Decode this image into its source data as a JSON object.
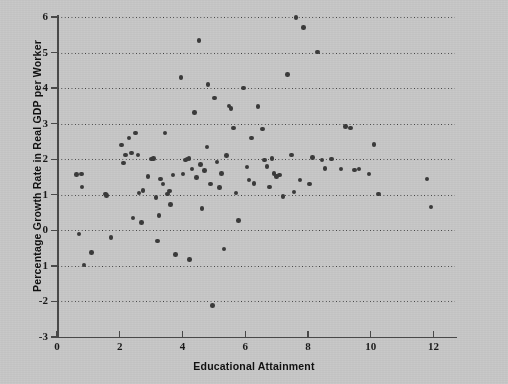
{
  "chart_data": {
    "type": "scatter",
    "title": "",
    "xlabel": "Educational Attainment",
    "ylabel": "Percentage Growth Rate in Real GDP per Worker",
    "xlim": [
      0,
      12.75
    ],
    "ylim": [
      -3,
      6
    ],
    "xticks": [
      0,
      2,
      4,
      6,
      8,
      10,
      12
    ],
    "xticklabels": [
      "0",
      "2",
      "4",
      "6",
      "8",
      "10",
      "12"
    ],
    "yticks": [
      6,
      5,
      4,
      3,
      2,
      1,
      0,
      -1,
      -2,
      -3
    ],
    "yticklabels": [
      "6",
      "5",
      "4",
      "3",
      "2",
      "1",
      "0",
      "1",
      "-2",
      "-3"
    ],
    "grid": "horizontal-dotted",
    "legend": "none",
    "marker": "filled-circle",
    "marker_color": "#3b3b3b",
    "background_color": "#c9c9c9",
    "points": [
      [
        0.62,
        1.57
      ],
      [
        0.7,
        -0.1
      ],
      [
        0.78,
        1.58
      ],
      [
        0.8,
        1.22
      ],
      [
        0.86,
        -0.98
      ],
      [
        1.1,
        -0.62
      ],
      [
        1.55,
        1.02
      ],
      [
        1.58,
        0.98
      ],
      [
        1.72,
        -0.2
      ],
      [
        2.05,
        2.4
      ],
      [
        2.12,
        1.9
      ],
      [
        2.18,
        2.12
      ],
      [
        2.3,
        2.6
      ],
      [
        2.38,
        2.18
      ],
      [
        2.42,
        0.35
      ],
      [
        2.5,
        2.74
      ],
      [
        2.58,
        2.12
      ],
      [
        2.62,
        1.05
      ],
      [
        2.7,
        0.22
      ],
      [
        2.74,
        1.12
      ],
      [
        2.9,
        1.52
      ],
      [
        3.02,
        2.0
      ],
      [
        3.08,
        2.02
      ],
      [
        3.15,
        0.92
      ],
      [
        3.2,
        -0.3
      ],
      [
        3.25,
        0.42
      ],
      [
        3.3,
        1.44
      ],
      [
        3.38,
        1.3
      ],
      [
        3.45,
        2.74
      ],
      [
        3.52,
        1.02
      ],
      [
        3.58,
        1.1
      ],
      [
        3.62,
        0.72
      ],
      [
        3.7,
        1.55
      ],
      [
        3.78,
        -0.68
      ],
      [
        3.95,
        4.3
      ],
      [
        4.02,
        1.58
      ],
      [
        4.1,
        1.98
      ],
      [
        4.15,
        2.0
      ],
      [
        4.2,
        2.02
      ],
      [
        4.22,
        -0.82
      ],
      [
        4.3,
        1.72
      ],
      [
        4.38,
        3.32
      ],
      [
        4.45,
        1.48
      ],
      [
        4.52,
        5.34
      ],
      [
        4.58,
        1.85
      ],
      [
        4.62,
        0.62
      ],
      [
        4.7,
        1.68
      ],
      [
        4.78,
        2.34
      ],
      [
        4.82,
        4.1
      ],
      [
        4.9,
        1.3
      ],
      [
        4.95,
        -2.12
      ],
      [
        5.02,
        3.72
      ],
      [
        5.1,
        1.92
      ],
      [
        5.18,
        1.2
      ],
      [
        5.25,
        1.6
      ],
      [
        5.32,
        -0.52
      ],
      [
        5.4,
        2.1
      ],
      [
        5.48,
        3.5
      ],
      [
        5.55,
        3.42
      ],
      [
        5.62,
        2.88
      ],
      [
        5.7,
        1.05
      ],
      [
        5.78,
        0.28
      ],
      [
        5.95,
        4.0
      ],
      [
        6.05,
        1.78
      ],
      [
        6.12,
        1.42
      ],
      [
        6.2,
        2.6
      ],
      [
        6.28,
        1.32
      ],
      [
        6.4,
        3.48
      ],
      [
        6.55,
        2.85
      ],
      [
        6.62,
        1.98
      ],
      [
        6.7,
        1.8
      ],
      [
        6.78,
        1.22
      ],
      [
        6.85,
        2.02
      ],
      [
        6.92,
        1.6
      ],
      [
        7.0,
        1.52
      ],
      [
        7.1,
        1.55
      ],
      [
        7.2,
        0.95
      ],
      [
        7.35,
        4.38
      ],
      [
        7.48,
        2.12
      ],
      [
        7.55,
        1.08
      ],
      [
        7.62,
        5.98
      ],
      [
        7.75,
        1.42
      ],
      [
        7.85,
        5.7
      ],
      [
        8.05,
        1.3
      ],
      [
        8.15,
        2.05
      ],
      [
        8.3,
        5.02
      ],
      [
        8.45,
        1.98
      ],
      [
        8.55,
        1.74
      ],
      [
        8.75,
        2.0
      ],
      [
        9.05,
        1.72
      ],
      [
        9.2,
        2.92
      ],
      [
        9.35,
        2.88
      ],
      [
        9.48,
        1.7
      ],
      [
        9.62,
        1.72
      ],
      [
        9.95,
        1.58
      ],
      [
        10.1,
        2.42
      ],
      [
        10.25,
        1.02
      ],
      [
        11.8,
        1.45
      ],
      [
        11.92,
        0.65
      ]
    ]
  }
}
